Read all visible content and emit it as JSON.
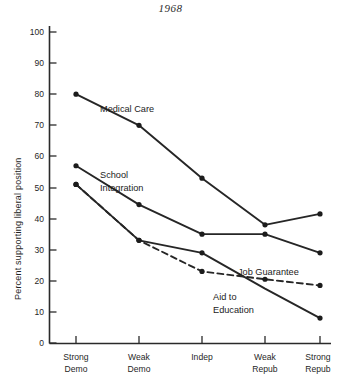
{
  "chart_data": {
    "type": "line",
    "title": "1968",
    "xlabel": "",
    "ylabel": "Percent supporting liberal position",
    "ylim": [
      0,
      100
    ],
    "yticks": [
      0,
      10,
      20,
      30,
      40,
      50,
      60,
      70,
      80,
      90,
      100
    ],
    "ytick_labels": [
      "0",
      "10",
      "20",
      "30",
      "40",
      "50",
      "60",
      "70",
      "80",
      "90",
      "100"
    ],
    "grid": false,
    "legend_position": "inline-annotations",
    "categories": [
      "Strong Demo",
      "Weak Demo",
      "Indep",
      "Weak Repub",
      "Strong Repub"
    ],
    "category_lines": [
      [
        "Strong",
        "Demo"
      ],
      [
        "Weak",
        "Demo"
      ],
      [
        "Indep",
        ""
      ],
      [
        "Weak",
        "Repub"
      ],
      [
        "Strong",
        "Repub"
      ]
    ],
    "series": [
      {
        "name": "Medical Care",
        "style": "solid",
        "values": [
          80,
          70,
          53,
          38,
          41.5
        ],
        "label": "Medical Care",
        "label_x": 2,
        "label_pos": {
          "x": 100,
          "y": 108
        }
      },
      {
        "name": "School Integration",
        "style": "solid",
        "values": [
          57,
          44.5,
          35,
          35,
          29
        ],
        "label": "School Integration",
        "label_pos": {
          "x": 100,
          "y": 175
        }
      },
      {
        "name": "Aid to Education",
        "style": "solid",
        "values": [
          51,
          33,
          29,
          17.5,
          8
        ],
        "label": "Aid to Education",
        "label_pos": {
          "x": 215,
          "y": 295
        }
      },
      {
        "name": "Job Guarantee",
        "style": "dashed",
        "values": [
          51,
          33,
          23,
          20.5,
          18.5
        ],
        "label": "Job Guarantee",
        "label_pos": {
          "x": 237,
          "y": 272
        }
      }
    ],
    "annotations": [
      {
        "text": "Medical Care",
        "series": "Medical Care"
      },
      {
        "text": "School",
        "series": "School Integration"
      },
      {
        "text": "Integration",
        "series": "School Integration"
      },
      {
        "text": "Job Guarantee",
        "series": "Job Guarantee"
      },
      {
        "text": "Aid to",
        "series": "Aid to Education"
      },
      {
        "text": "Education",
        "series": "Aid to Education"
      }
    ],
    "colors": {
      "line": "#262626",
      "axis": "#2a2a2a",
      "text": "#1f1f1f",
      "background": "#ffffff"
    }
  },
  "axis": {
    "y_title": "Percent supporting liberal position",
    "tick_0": "0",
    "tick_10": "10",
    "tick_20": "20",
    "tick_30": "30",
    "tick_40": "40",
    "tick_50": "50",
    "tick_60": "60",
    "tick_70": "70",
    "tick_80": "80",
    "tick_90": "90",
    "tick_100": "100"
  },
  "xaxis": {
    "cat0_line1": "Strong",
    "cat0_line2": "Demo",
    "cat1_line1": "Weak",
    "cat1_line2": "Demo",
    "cat2_line1": "Indep",
    "cat3_line1": "Weak",
    "cat3_line2": "Repub",
    "cat4_line1": "Strong",
    "cat4_line2": "Repub"
  },
  "annotations": {
    "medical_care": "Medical Care",
    "school_line1": "School",
    "school_line2": "Integration",
    "job_guarantee": "Job Guarantee",
    "aid_line1": "Aid to",
    "aid_line2": "Education"
  },
  "header": {
    "title": "1968"
  }
}
